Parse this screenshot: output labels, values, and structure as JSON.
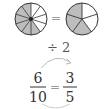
{
  "diagram": {
    "left_pie": {
      "segments": 10,
      "shaded": 6,
      "fill": "#bdbdbd",
      "stroke": "#333333"
    },
    "right_pie": {
      "segments": 5,
      "shaded": 3,
      "fill": "#bdbdbd",
      "stroke": "#333333"
    },
    "equals": "=",
    "operation": "÷ 2",
    "fraction_left": {
      "numerator": "6",
      "denominator": "10"
    },
    "fraction_right": {
      "numerator": "3",
      "denominator": "5"
    },
    "fraction_equals": "="
  }
}
